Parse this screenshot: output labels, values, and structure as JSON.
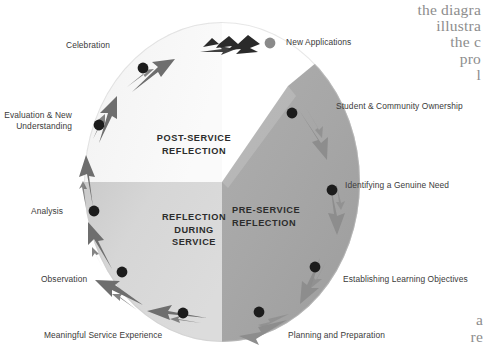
{
  "diagram": {
    "type": "cycle-diagram",
    "zones": [
      {
        "id": "post-service",
        "label": "POST-SERVICE\nREFLECTION",
        "color": "#f2f2f2",
        "position": "upper-left quadrant"
      },
      {
        "id": "reflection-during-service",
        "label": "REFLECTION\nDURING\nSERVICE",
        "color": "#d2d2d2",
        "position": "lower-left quadrant"
      },
      {
        "id": "pre-service",
        "label": "PRE-SERVICE\nREFLECTION",
        "color": "#a9a9a9",
        "position": "right teardrop wedge"
      }
    ],
    "stages_left": [
      {
        "id": "celebration",
        "label": "Celebration"
      },
      {
        "id": "evaluation-new-understanding",
        "label": "Evaluation & New\nUnderstanding"
      },
      {
        "id": "analysis",
        "label": "Analysis"
      },
      {
        "id": "observation",
        "label": "Observation"
      },
      {
        "id": "meaningful-service-experience",
        "label": "Meaningful Service Experience"
      }
    ],
    "stages_right": [
      {
        "id": "student-community-ownership",
        "label": "Student & Community Ownership"
      },
      {
        "id": "identifying-genuine-need",
        "label": "Identifying a Genuine Need"
      },
      {
        "id": "establishing-learning-objectives",
        "label": "Establishing Learning Objectives"
      },
      {
        "id": "planning-and-preparation",
        "label": "Planning and Preparation"
      }
    ],
    "outcome": {
      "id": "new-applications",
      "label": "New Applications"
    },
    "colors": {
      "zone_light": "#f2f2f2",
      "zone_mid": "#d2d2d2",
      "zone_dark": "#a9a9a9",
      "arrow_left": "#6e6e6e",
      "arrow_right": "#8d8d8d",
      "arrow_exit": "#2a2a2a",
      "dot": "#1c1c1c",
      "dot_outcome": "#8a8a8a",
      "label_text": "#3a3a3a",
      "body_text": "#8d8d8d"
    }
  },
  "page_text": {
    "top_fragment": "the diagra\nillustra\nthe c\npro\nl",
    "bottom_fragment": "a\nre"
  }
}
